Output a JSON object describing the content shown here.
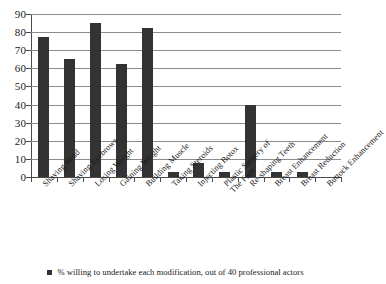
{
  "chart_data": {
    "type": "bar",
    "title": "",
    "subtitle": "",
    "xlabel": "",
    "ylabel": "",
    "ylim": [
      0,
      90
    ],
    "ytick_step": 10,
    "yticks": [
      0,
      10,
      20,
      30,
      40,
      50,
      60,
      70,
      80,
      90
    ],
    "ytick_labels": [
      "0",
      "10",
      "20",
      "30",
      "40",
      "50",
      "60",
      "70",
      "80",
      "90"
    ],
    "grid": true,
    "grid_orientation": "horizontal",
    "legend_position": "bottom",
    "bar_color": "#333333",
    "gridline_color": "#8c8c8c",
    "axis_color": "#4a4a4a",
    "background_color": "#ffffff",
    "categories": [
      "Shaving Head",
      "Shaving Eyebrows",
      "Losing Weight",
      "Gaining Weight",
      "Building Muscle",
      "Taking Steroids",
      "Injecting Botox",
      "Plastic Surgery of The Face",
      "Re-shaping Teeth",
      "Breast Enhancement",
      "Breast Reduction",
      "Buttock Enhancement"
    ],
    "category_lines": [
      [
        "Shaving Head"
      ],
      [
        "Shaving Eyebrows"
      ],
      [
        "Losing Weight"
      ],
      [
        "Gaining Weight"
      ],
      [
        "Building Muscle"
      ],
      [
        "Taking Steroids"
      ],
      [
        "Injecting Botox"
      ],
      [
        "Plastic Surgery of",
        "The Face"
      ],
      [
        "Re-shaping Teeth"
      ],
      [
        "Breast Enhancement"
      ],
      [
        "Breast Reduction"
      ],
      [
        "Buttock Enhancement"
      ]
    ],
    "values": [
      77.5,
      65,
      85,
      62.5,
      82.5,
      2.5,
      7.5,
      2.5,
      40,
      2.5,
      2.5,
      0
    ],
    "series": [
      {
        "name": "% willing to undertake each modification, out of 40 professional actors",
        "values": [
          77.5,
          65,
          85,
          62.5,
          82.5,
          2.5,
          7.5,
          2.5,
          40,
          2.5,
          2.5,
          0
        ]
      }
    ]
  },
  "legend": {
    "label": "% willing to undertake each modification, out of 40 professional actors",
    "marker": "square-marker"
  }
}
